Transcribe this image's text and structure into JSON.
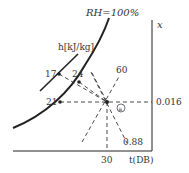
{
  "diagram": {
    "labels": {
      "rh": "RH=100%",
      "enthalpy": "h[kJ/kg]",
      "humidity_axis": "x",
      "temp_axis": "t(DB)",
      "h17": "17",
      "h24": "24",
      "t21": "21",
      "rh60": "60",
      "shf": "0.88",
      "x_value": "0.016",
      "t_value": "30",
      "point": "a"
    },
    "colors": {
      "line": "#222222",
      "text": "#333333",
      "background": "#ffffff"
    }
  }
}
